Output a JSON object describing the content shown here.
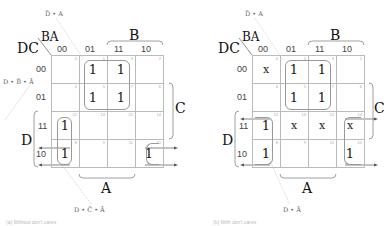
{
  "maps": [
    {
      "axis_corner": {
        "row_vars": "DC",
        "col_vars": "BA"
      },
      "col_headers": [
        "00",
        "01",
        "11",
        "10"
      ],
      "row_headers": [
        "00",
        "01",
        "11",
        "10"
      ],
      "cells": [
        [
          {
            "idx": "0",
            "val": ""
          },
          {
            "idx": "1",
            "val": "1"
          },
          {
            "idx": "3",
            "val": "1"
          },
          {
            "idx": "2",
            "val": ""
          }
        ],
        [
          {
            "idx": "4",
            "val": ""
          },
          {
            "idx": "5",
            "val": "1"
          },
          {
            "idx": "7",
            "val": "1"
          },
          {
            "idx": "6",
            "val": ""
          }
        ],
        [
          {
            "idx": "12",
            "val": "1"
          },
          {
            "idx": "13",
            "val": ""
          },
          {
            "idx": "15",
            "val": ""
          },
          {
            "idx": "14",
            "val": ""
          }
        ],
        [
          {
            "idx": "8",
            "val": "1"
          },
          {
            "idx": "9",
            "val": ""
          },
          {
            "idx": "11",
            "val": ""
          },
          {
            "idx": "10",
            "val": "1"
          }
        ]
      ],
      "var_labels": {
        "B": "B",
        "C": "C",
        "D": "D",
        "A": "A"
      },
      "terms": {
        "top": "D̄ • A",
        "left": "D • B̄ • Ā",
        "bottom": "D • C̄ • Ā"
      },
      "caption": "(a) Without don't cares"
    },
    {
      "axis_corner": {
        "row_vars": "DC",
        "col_vars": "BA"
      },
      "col_headers": [
        "00",
        "01",
        "11",
        "10"
      ],
      "row_headers": [
        "00",
        "01",
        "11",
        "10"
      ],
      "cells": [
        [
          {
            "idx": "0",
            "val": "x"
          },
          {
            "idx": "1",
            "val": "1"
          },
          {
            "idx": "3",
            "val": "1"
          },
          {
            "idx": "2",
            "val": ""
          }
        ],
        [
          {
            "idx": "4",
            "val": ""
          },
          {
            "idx": "5",
            "val": "1"
          },
          {
            "idx": "7",
            "val": "1"
          },
          {
            "idx": "6",
            "val": ""
          }
        ],
        [
          {
            "idx": "12",
            "val": "1"
          },
          {
            "idx": "13",
            "val": "x"
          },
          {
            "idx": "15",
            "val": "x"
          },
          {
            "idx": "14",
            "val": "x"
          }
        ],
        [
          {
            "idx": "8",
            "val": "1"
          },
          {
            "idx": "9",
            "val": ""
          },
          {
            "idx": "11",
            "val": ""
          },
          {
            "idx": "10",
            "val": "1"
          }
        ]
      ],
      "var_labels": {
        "B": "B",
        "C": "C",
        "D": "D",
        "A": "A"
      },
      "terms": {
        "top": "D̄ • A",
        "bottom": "D • Ā"
      },
      "caption": "(b) With don't cares"
    }
  ]
}
